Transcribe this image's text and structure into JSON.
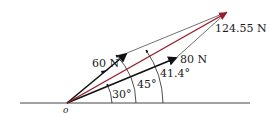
{
  "diagram": {
    "type": "vector-addition",
    "origin_label": "o",
    "colors": {
      "resultant": "#9b1b2a",
      "vectors": "#111111",
      "construction": "#333333",
      "baseline": "#444444"
    },
    "vectors": [
      {
        "name": "F1",
        "label": "60 N",
        "magnitude": 60,
        "unit": "N",
        "angle_deg": 45,
        "angle_label": "45°"
      },
      {
        "name": "F2",
        "label": "80 N",
        "magnitude": 80,
        "unit": "N",
        "angle_deg": 30,
        "angle_label": "30°"
      }
    ],
    "resultant": {
      "label": "124.55 N",
      "magnitude": 124.55,
      "unit": "N",
      "angle_deg": 41.4,
      "angle_label": "41.4°"
    }
  }
}
